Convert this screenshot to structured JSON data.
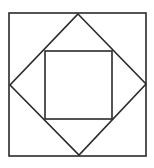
{
  "diagram": {
    "type": "nested-squares",
    "stroke_color": "#2a2a2a",
    "background": "#ffffff",
    "outer_square": {
      "x1": 9,
      "y1": 13,
      "x2": 146,
      "y2": 156
    },
    "diamond": {
      "top": [
        78,
        14
      ],
      "right": [
        146,
        84
      ],
      "bottom": [
        79,
        155
      ],
      "left": [
        10,
        85
      ]
    },
    "inner_square": {
      "x1": 45,
      "y1": 51,
      "x2": 112,
      "y2": 119
    }
  }
}
